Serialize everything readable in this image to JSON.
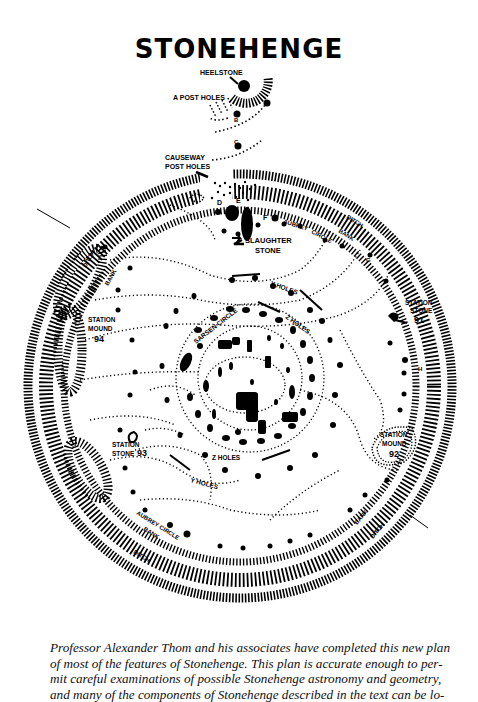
{
  "title": "STONEHENGE",
  "labels": {
    "heelstone": "HEELSTONE",
    "a_post_holes": "A POST HOLES",
    "b": "B",
    "c": "C",
    "causeway_post_holes_1": "CAUSEWAY",
    "causeway_post_holes_2": "POST HOLES",
    "d": "D",
    "e": "E",
    "f": "F",
    "g": "G",
    "h": "H",
    "slaughter_stone_1": "SLAUGHTER",
    "slaughter_stone_2": "STONE",
    "ditch_ne": "DITCH",
    "bank_ne": "BANK",
    "aubrey_ne": "AUBREY",
    "circle_ne": "CIRCLE",
    "ditch_nw": "DITCH",
    "bank_nw": "BANK",
    "station_stone_91_1": "STATION",
    "station_stone_91_2": "STONE",
    "station_stone_91_num": "91",
    "station_mound_94_1": "STATION",
    "station_mound_94_2": "MOUND",
    "station_mound_94_num": "94",
    "y_holes_n": "Y HOLES",
    "z_holes_n": "Z HOLES",
    "sarsen_circle": "SARSEN CIRCLE",
    "z_holes_s": "Z HOLES",
    "y_holes_s": "Y HOLES",
    "station_stone_93_1": "STATION",
    "station_stone_93_2": "STONE",
    "station_stone_93_num": "93",
    "station_mound_92_1": "STATION",
    "station_mound_92_2": "MOUND",
    "station_mound_92_num": "92",
    "aubrey_circle_sw": "AUBREY CIRCLE",
    "bank_sw": "BANK",
    "ditch_sw": "DITCH",
    "bank_se": "BANK",
    "ditch_se": "DITCH"
  },
  "caption": {
    "lines": [
      "Professor Alexander Thom and his associates have completed this new plan",
      "of most of the features of Stonehenge. This plan is accurate enough to per-",
      "mit careful examinations of possible Stonehenge astronomy and geometry,",
      "and many of the components of Stonehenge described in the text can be lo-"
    ]
  },
  "colors": {
    "ink": "#000000",
    "paper": "#ffffff",
    "caption_text": "#111111"
  }
}
